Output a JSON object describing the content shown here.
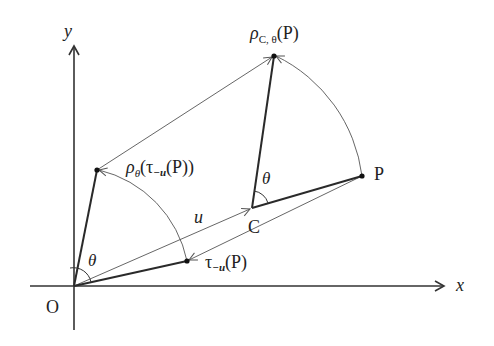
{
  "figure": {
    "axes": {
      "x_label": "x",
      "y_label": "y",
      "origin_label": "O"
    },
    "points": {
      "P": {
        "label": "P",
        "x": 362,
        "y": 176
      },
      "C": {
        "label": "C",
        "x": 252,
        "y": 208
      },
      "rotated_about_C": {
        "label_main": "ρ",
        "label_sub": "C, θ",
        "label_arg": "(P)",
        "x": 274,
        "y": 56
      },
      "translated": {
        "label_main": "τ",
        "label_sub": "−u",
        "label_arg": "(P)",
        "x": 187,
        "y": 261
      },
      "rotated_translated": {
        "label_main": "ρ",
        "label_sub": "θ",
        "label_open": "(τ",
        "label_sub2": "−u",
        "label_arg": "(P))",
        "x": 97,
        "y": 170
      }
    },
    "vector_label": "u",
    "angle_label_origin": "θ",
    "angle_label_C": "θ",
    "colors": {
      "thick_line": "#2a2a2a",
      "thin_line": "#555555",
      "axis": "#333333",
      "text": "#222222"
    }
  }
}
